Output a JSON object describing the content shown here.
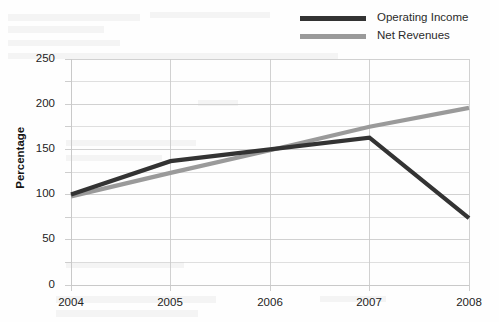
{
  "chart_data": {
    "type": "line",
    "title": "",
    "subtitle": "",
    "xlabel": "",
    "ylabel": "Percentage",
    "categories": [
      "2004",
      "2005",
      "2006",
      "2007",
      "2008"
    ],
    "x": [
      2004,
      2005,
      2006,
      2007,
      2008
    ],
    "xlim": [
      2004,
      2008
    ],
    "ylim": [
      0,
      250
    ],
    "y_ticks": [
      0,
      50,
      100,
      150,
      200,
      250
    ],
    "y_tick_labels": [
      "0",
      "50",
      "100",
      "150",
      "200",
      "250"
    ],
    "x_tick_labels": [
      "2004",
      "2005",
      "2006",
      "2007",
      "2008"
    ],
    "grid": true,
    "grid_minor_step": 25,
    "grid_color": "#c9c9c9",
    "legend_position": "top-right",
    "series": [
      {
        "name": "Operating Income",
        "color": "#333333",
        "values": [
          100,
          137,
          150,
          163,
          74
        ]
      },
      {
        "name": "Net Revenues",
        "color": "#9a9a9a",
        "values": [
          98,
          124,
          149,
          175,
          196
        ]
      }
    ]
  },
  "legend": {
    "items": [
      {
        "label": "Operating Income",
        "color": "#333333"
      },
      {
        "label": "Net Revenues",
        "color": "#9a9a9a"
      }
    ]
  },
  "axes": {
    "y_title": "Percentage",
    "y_labels": [
      "250",
      "200",
      "150",
      "100",
      "50",
      "0"
    ],
    "x_labels": [
      "2004",
      "2005",
      "2006",
      "2007",
      "2008"
    ]
  },
  "colors": {
    "background": "#fefefe",
    "grid": "#c9c9c9",
    "text": "#232323",
    "series_dark": "#333333",
    "series_gray": "#9a9a9a"
  }
}
